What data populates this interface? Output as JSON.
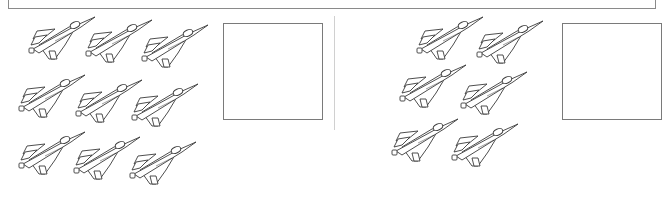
{
  "worksheet": {
    "type": "counting-exercise",
    "icon": "fighter-jet-icon",
    "colors": {
      "line": "#3a3a3a",
      "box_border": "#7a7a7a",
      "divider": "#d0d0d0"
    },
    "panels": [
      {
        "name": "left",
        "jet_count": 9,
        "answer": "",
        "jets": [
          {
            "x": 25,
            "y": 15
          },
          {
            "x": 82,
            "y": 18
          },
          {
            "x": 138,
            "y": 23
          },
          {
            "x": 15,
            "y": 73
          },
          {
            "x": 72,
            "y": 78
          },
          {
            "x": 128,
            "y": 82
          },
          {
            "x": 15,
            "y": 130
          },
          {
            "x": 70,
            "y": 135
          },
          {
            "x": 126,
            "y": 140
          }
        ],
        "box": {
          "x": 223,
          "y": 23
        }
      },
      {
        "name": "right",
        "jet_count": 6,
        "answer": "",
        "jets": [
          {
            "x": 413,
            "y": 15
          },
          {
            "x": 473,
            "y": 19
          },
          {
            "x": 396,
            "y": 63
          },
          {
            "x": 457,
            "y": 70
          },
          {
            "x": 388,
            "y": 117
          },
          {
            "x": 448,
            "y": 122
          }
        ],
        "box": {
          "x": 562,
          "y": 23
        }
      }
    ]
  }
}
